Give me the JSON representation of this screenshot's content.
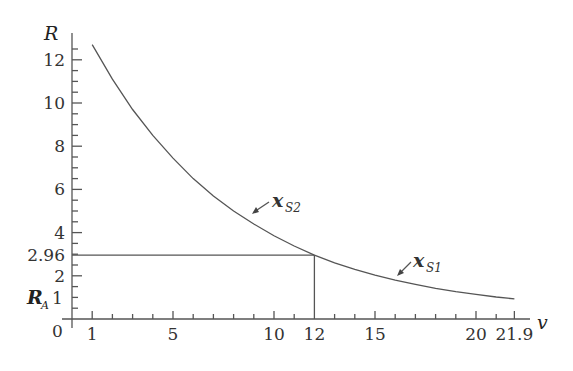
{
  "chart_data": {
    "type": "line",
    "title": "",
    "xlabel": "v",
    "ylabel": "R",
    "xlim": [
      0,
      22.5
    ],
    "ylim": [
      0,
      13
    ],
    "grid": false,
    "x_ticks": [
      1,
      5,
      10,
      12,
      15,
      20,
      21.9
    ],
    "x_tick_labels": [
      "1",
      "5",
      "10",
      "12",
      "15",
      "20",
      "21.9"
    ],
    "x_minor_ticks": [
      2,
      3,
      4,
      6,
      7,
      8,
      9,
      11,
      13,
      14,
      16,
      17,
      18,
      19,
      21
    ],
    "y_ticks": [
      0,
      2,
      2.96,
      4,
      6,
      8,
      10,
      12
    ],
    "y_tick_labels": [
      "0",
      "2",
      "2.96",
      "4",
      "6",
      "8",
      "10",
      "12"
    ],
    "y_extra_label": {
      "text": "R",
      "sub": "A",
      "value": "1",
      "y": 1
    },
    "y_minor_ticks": [
      0.5,
      1,
      1.5,
      2.5,
      3,
      3.5,
      4.5,
      5,
      5.5,
      6.5,
      7,
      7.5,
      8.5,
      9,
      9.5,
      10.5,
      11,
      11.5,
      12.5
    ],
    "series": [
      {
        "name": "R(v)",
        "x": [
          1,
          2,
          3,
          4,
          5,
          6,
          7,
          8,
          9,
          10,
          11,
          12,
          13,
          14,
          15,
          16,
          17,
          18,
          19,
          20,
          21,
          21.9
        ],
        "values": [
          12.7,
          11.1,
          9.7,
          8.5,
          7.45,
          6.5,
          5.7,
          5.0,
          4.4,
          3.85,
          3.38,
          2.96,
          2.6,
          2.3,
          2.03,
          1.8,
          1.6,
          1.42,
          1.27,
          1.14,
          1.02,
          0.93
        ]
      }
    ],
    "annotations": [
      {
        "text": "x",
        "sub": "S2",
        "arrow_to": [
          9.2,
          4.0
        ]
      },
      {
        "text": "x",
        "sub": "S1",
        "arrow_to": [
          16.1,
          1.8
        ]
      },
      {
        "type": "guide",
        "from": [
          0,
          2.96
        ],
        "to": [
          12,
          2.96
        ]
      },
      {
        "type": "guide",
        "from": [
          12,
          0
        ],
        "to": [
          12,
          2.96
        ]
      }
    ]
  },
  "labels": {
    "y_axis": "R",
    "x_axis": "v",
    "origin": "0",
    "ra_main": "R",
    "ra_sub": "A",
    "ra_value": "1",
    "xs2_main": "x",
    "xs2_sub": "S2",
    "xs1_main": "x",
    "xs1_sub": "S1"
  }
}
